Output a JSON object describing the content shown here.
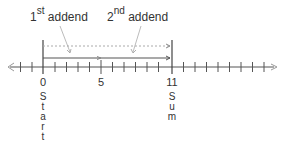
{
  "labels": {
    "first_addend": {
      "num": "1",
      "sup": "st",
      "text": "addend"
    },
    "second_addend": {
      "num": "2",
      "sup": "nd",
      "text": "addend"
    }
  },
  "number_line": {
    "tick_labels": [
      {
        "value": "0",
        "x": 43
      },
      {
        "value": "5",
        "x": 101
      },
      {
        "value": "11",
        "x": 172
      }
    ],
    "start_word": "Start",
    "sum_word": "Sum",
    "line_color": "#555555",
    "arrow_color": "#888888"
  },
  "chart_data": {
    "type": "number_line",
    "title": "",
    "tick_start": -2,
    "tick_end": 20,
    "labeled_ticks": [
      0,
      5,
      11
    ],
    "start": 0,
    "sum": 11,
    "annotations": [
      "1st addend",
      "2nd addend",
      "Start",
      "Sum"
    ]
  }
}
